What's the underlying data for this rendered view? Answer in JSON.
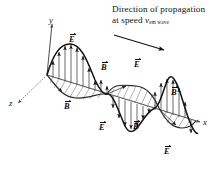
{
  "figure": {
    "background": "#ffffff",
    "line_color": "#111111",
    "hatch_color": "#6e6e6e",
    "axis_color": "#555555"
  },
  "caption": {
    "line1": "Direction of propagation",
    "line2_prefix": "at speed ",
    "line2_symbol": "v",
    "line2_subscript": "em wave"
  },
  "axes": [
    {
      "name": "y-axis",
      "label": "y"
    },
    {
      "name": "x-axis",
      "label": "x"
    },
    {
      "name": "z-axis",
      "label": "z"
    }
  ],
  "vector_labels": [
    {
      "name": "E-label-1",
      "symbol": "E",
      "field": "electric",
      "x": 69,
      "y": 33
    },
    {
      "name": "B-label-1",
      "symbol": "B",
      "field": "magnetic",
      "x": 64,
      "y": 100
    },
    {
      "name": "B-label-2",
      "symbol": "B",
      "field": "magnetic",
      "x": 101,
      "y": 61
    },
    {
      "name": "E-label-2",
      "symbol": "E",
      "field": "electric",
      "x": 134,
      "y": 58
    },
    {
      "name": "E-label-3",
      "symbol": "E",
      "field": "electric",
      "x": 99,
      "y": 121
    },
    {
      "name": "B-label-3",
      "symbol": "B",
      "field": "magnetic",
      "x": 133,
      "y": 120
    },
    {
      "name": "B-label-4",
      "symbol": "B",
      "field": "magnetic",
      "x": 171,
      "y": 86
    },
    {
      "name": "E-label-4",
      "symbol": "E",
      "field": "electric",
      "x": 164,
      "y": 145
    }
  ],
  "chart_data": {
    "type": "line",
    "xlabel": "x",
    "ylabel": "y",
    "zlabel": "z",
    "series": [
      {
        "name": "E",
        "plane": "xy",
        "amplitude": 1.0,
        "cycles": 2,
        "phase": 0
      },
      {
        "name": "B",
        "plane": "xz",
        "amplitude": 1.0,
        "cycles": 2,
        "phase": 0
      }
    ],
    "propagation_direction": "+x",
    "grid": false,
    "legend": false
  }
}
